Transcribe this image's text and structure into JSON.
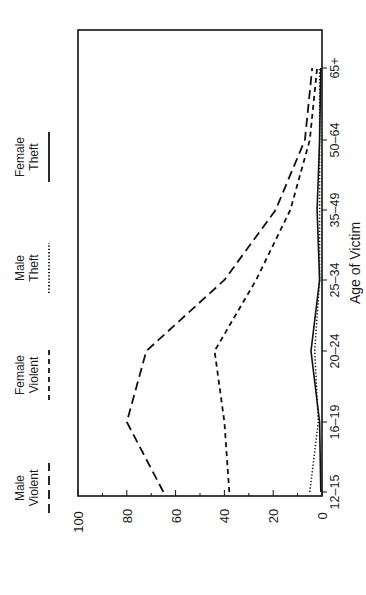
{
  "chart_data": {
    "type": "line",
    "orientation": "rotated-90-ccw",
    "title": "",
    "xlabel": "Age of Victim",
    "ylabel": "",
    "ylim": [
      0,
      100
    ],
    "yticks": [
      "0",
      "20",
      "40",
      "60",
      "80",
      "100"
    ],
    "categories": [
      "12-15",
      "16-19",
      "20-24",
      "25-34",
      "35-49",
      "50-64",
      "65+"
    ],
    "legend_position": "top (left side when rotated)",
    "series": [
      {
        "name": "Male Violent",
        "style": "long-dash",
        "values": [
          65,
          80,
          72,
          40,
          19,
          7,
          4
        ]
      },
      {
        "name": "Female Violent",
        "style": "short-dash",
        "values": [
          38,
          40,
          44,
          27,
          13,
          5,
          2
        ]
      },
      {
        "name": "Male Theft",
        "style": "dotted",
        "values": [
          5,
          1.5,
          3,
          1,
          1,
          1,
          1
        ]
      },
      {
        "name": "Female Theft",
        "style": "solid",
        "values": [
          0.5,
          1,
          4.5,
          1,
          2,
          1,
          0.5
        ]
      }
    ],
    "grid": false
  },
  "legend": {
    "items": [
      {
        "line1": "Male",
        "line2": "Violent"
      },
      {
        "line1": "Female",
        "line2": "Violent"
      },
      {
        "line1": "Male",
        "line2": "Theft"
      },
      {
        "line1": "Female",
        "line2": "Theft"
      }
    ]
  }
}
